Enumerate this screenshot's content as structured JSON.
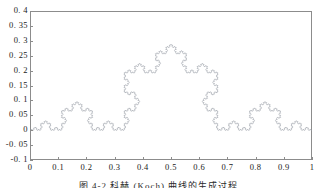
{
  "figure": {
    "caption": "图 4-2   科赫 (Koch) 曲线的生成过程",
    "line_color": "#9aa0a8",
    "frame_color": "#8c8c8c",
    "background": "#ffffff"
  },
  "chart_data": {
    "type": "line",
    "title": "",
    "xlabel": "",
    "ylabel": "",
    "xlim": [
      0,
      1
    ],
    "ylim": [
      -0.1,
      0.4
    ],
    "grid": false,
    "legend": null,
    "xticks": [
      0,
      0.1,
      0.2,
      0.3,
      0.4,
      0.5,
      0.6,
      0.7,
      0.8,
      0.9,
      1
    ],
    "xtick_labels": [
      "0",
      "0.1",
      "0.2",
      "0.3",
      "0.4",
      "0.5",
      "0.6",
      "0.7",
      "0.8",
      "0.9",
      "1"
    ],
    "yticks": [
      -0.1,
      -0.05,
      0,
      0.05,
      0.1,
      0.15,
      0.2,
      0.25,
      0.3,
      0.35,
      0.4
    ],
    "ytick_labels": [
      "-0. 1",
      "-0. 05",
      "0",
      "0. 05",
      "0. 1",
      "0. 15",
      "0. 2",
      "0. 25",
      "0. 3",
      "0. 35",
      "0. 4"
    ],
    "series": [
      {
        "name": "Koch curve",
        "kind": "koch",
        "iterations": 5,
        "start": [
          0,
          0
        ],
        "end": [
          1,
          0
        ],
        "peak": [
          0.5,
          0.2887
        ],
        "color": "#9aa0a8",
        "linewidth": 0.6
      }
    ]
  }
}
